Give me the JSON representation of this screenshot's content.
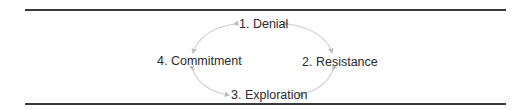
{
  "diagram": {
    "type": "cycle",
    "nodes": [
      {
        "id": 1,
        "label": "1. Denial"
      },
      {
        "id": 2,
        "label": "2. Resistance"
      },
      {
        "id": 3,
        "label": "3. Exploration"
      },
      {
        "id": 4,
        "label": "4. Commitment"
      }
    ],
    "edges": [
      {
        "from": "1. Denial",
        "to": "2. Resistance",
        "bidirectional": true
      },
      {
        "from": "2. Resistance",
        "to": "3. Exploration",
        "bidirectional": true
      },
      {
        "from": "3. Exploration",
        "to": "4. Commitment",
        "bidirectional": true
      },
      {
        "from": "4. Commitment",
        "to": "1. Denial",
        "bidirectional": true
      }
    ],
    "colors": {
      "rule": "#3a3a3a",
      "arrow": "#c8c8c8",
      "text": "#2b2b2b"
    }
  }
}
